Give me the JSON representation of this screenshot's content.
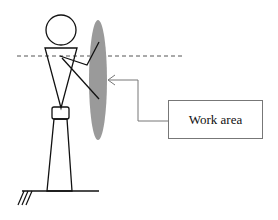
{
  "diagram": {
    "label": "Work area",
    "colors": {
      "line": "#111111",
      "work_area_fill": "#9a9a9a",
      "arrow": "#777777",
      "dashed": "#555555"
    }
  }
}
